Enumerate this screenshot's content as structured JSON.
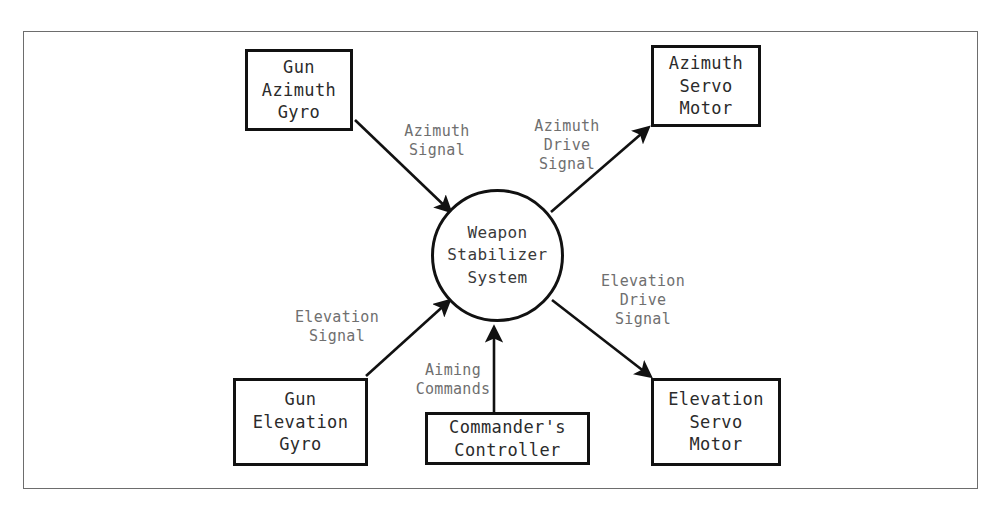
{
  "diagram": {
    "frame": {
      "color": "#6d6d6d"
    },
    "process": {
      "id": "weapon-stabilizer-system",
      "label": "Weapon\nStabilizer\nSystem"
    },
    "entities": [
      {
        "id": "gun-azimuth-gyro",
        "label": "Gun\nAzimuth\nGyro"
      },
      {
        "id": "azimuth-servo-motor",
        "label": "Azimuth\nServo\nMotor"
      },
      {
        "id": "gun-elevation-gyro",
        "label": "Gun\nElevation\nGyro"
      },
      {
        "id": "commanders-controller",
        "label": "Commander's\nController"
      },
      {
        "id": "elevation-servo-motor",
        "label": "Elevation\nServo\nMotor"
      }
    ],
    "flows": [
      {
        "id": "azimuth-signal",
        "label": "Azimuth\nSignal",
        "from": "gun-azimuth-gyro",
        "to": "weapon-stabilizer-system"
      },
      {
        "id": "azimuth-drive-signal",
        "label": "Azimuth\nDrive\nSignal",
        "from": "weapon-stabilizer-system",
        "to": "azimuth-servo-motor"
      },
      {
        "id": "elevation-signal",
        "label": "Elevation\nSignal",
        "from": "gun-elevation-gyro",
        "to": "weapon-stabilizer-system"
      },
      {
        "id": "aiming-commands",
        "label": "Aiming\nCommands",
        "from": "commanders-controller",
        "to": "weapon-stabilizer-system"
      },
      {
        "id": "elevation-drive-signal",
        "label": "Elevation\nDrive\nSignal",
        "from": "weapon-stabilizer-system",
        "to": "elevation-servo-motor"
      }
    ],
    "colors": {
      "node_stroke": "#111111",
      "node_text": "#2b2b2b",
      "process_text": "#3a3a3a",
      "flow_label_text": "#6f6f6f",
      "background": "#ffffff"
    }
  }
}
